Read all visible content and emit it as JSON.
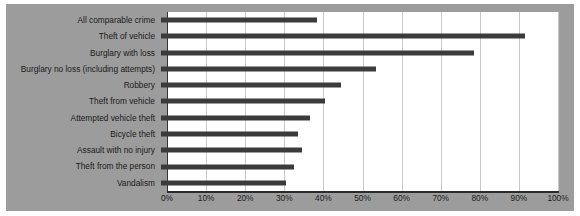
{
  "chart_data": {
    "type": "bar",
    "orientation": "horizontal",
    "title": "",
    "subtitle": "",
    "xlabel": "",
    "ylabel": "",
    "xlim": [
      0,
      100
    ],
    "xtick_values": [
      0,
      10,
      20,
      30,
      40,
      50,
      60,
      70,
      80,
      90,
      100
    ],
    "xtick_labels": [
      "0%",
      "10%",
      "20%",
      "30%",
      "40%",
      "50%",
      "60%",
      "70%",
      "80%",
      "90%",
      "100%"
    ],
    "grid": "vertical",
    "legend": "none",
    "categories": [
      "All comparable crime",
      "Theft of vehicle",
      "Burglary with loss",
      "Burglary no loss (including attempts)",
      "Robbery",
      "Theft from vehicle",
      "Attempted vehicle theft",
      "Bicycle theft",
      "Assault with no injury",
      "Theft from the person",
      "Vandalism"
    ],
    "values": [
      40,
      93,
      80,
      55,
      46,
      42,
      38,
      35,
      36,
      34,
      32
    ],
    "bars": [
      {
        "label": "All comparable crime",
        "value": 40
      },
      {
        "label": "Theft of vehicle",
        "value": 93
      },
      {
        "label": "Burglary with loss",
        "value": 80
      },
      {
        "label": "Burglary no loss (including attempts)",
        "value": 55
      },
      {
        "label": "Robbery",
        "value": 46
      },
      {
        "label": "Theft from vehicle",
        "value": 42
      },
      {
        "label": "Attempted vehicle theft",
        "value": 38
      },
      {
        "label": "Bicycle theft",
        "value": 35
      },
      {
        "label": "Assault with no injury",
        "value": 36
      },
      {
        "label": "Theft from the person",
        "value": 34
      },
      {
        "label": "Vandalism",
        "value": 32
      }
    ],
    "colors": {
      "bar": "#3b3b3b",
      "figure_background": "#9c9c9c",
      "plot_background": "#ffffff",
      "gridline": "#c9c9c9",
      "axis": "#2b2b2b",
      "text": "#1a1a1a"
    }
  }
}
